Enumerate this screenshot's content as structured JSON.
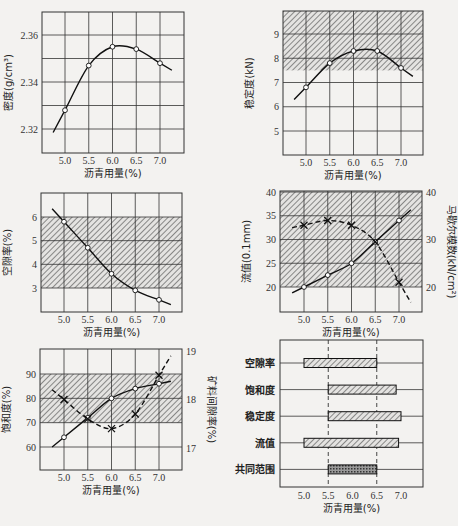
{
  "figure": {
    "xlabel_common": "沥青用量(%)"
  },
  "chart_data": [
    {
      "type": "line",
      "title": "",
      "xlabel": "沥青用量(%)",
      "ylabel": "密度(g/cm³)",
      "x_ticks": [
        "5.0",
        "5.5",
        "6.0",
        "6.5",
        "7.0"
      ],
      "y_ticks": [
        "2.32",
        "2.34",
        "2.36"
      ],
      "ylim": [
        2.31,
        2.37
      ],
      "grid": true,
      "series": [
        {
          "name": "密度",
          "x": [
            5.0,
            5.5,
            6.0,
            6.5,
            7.0
          ],
          "values": [
            2.328,
            2.347,
            2.355,
            2.354,
            2.348
          ]
        }
      ]
    },
    {
      "type": "line",
      "xlabel": "沥青用量(%)",
      "ylabel": "稳定度(kN)",
      "x_ticks": [
        "5.0",
        "5.5",
        "6.0",
        "6.5",
        "7.0"
      ],
      "y_ticks": [
        "5",
        "6",
        "7",
        "8",
        "9"
      ],
      "ylim": [
        4,
        10
      ],
      "grid": true,
      "shaded_range": [
        7.5,
        10
      ],
      "series": [
        {
          "name": "稳定度",
          "x": [
            5.0,
            5.5,
            6.0,
            6.5,
            7.0
          ],
          "values": [
            6.8,
            7.8,
            8.3,
            8.3,
            7.6
          ]
        }
      ]
    },
    {
      "type": "line",
      "xlabel": "沥青用量(%)",
      "ylabel": "空隙率(%)",
      "x_ticks": [
        "5.0",
        "5.5",
        "6.0",
        "6.5",
        "7.0"
      ],
      "y_ticks": [
        "3",
        "4",
        "5",
        "6"
      ],
      "ylim": [
        2,
        7
      ],
      "grid": true,
      "shaded_range": [
        3,
        6
      ],
      "series": [
        {
          "name": "空隙率",
          "x": [
            5.0,
            5.5,
            6.0,
            6.5,
            7.0
          ],
          "values": [
            5.8,
            4.7,
            3.6,
            2.9,
            2.5
          ]
        }
      ]
    },
    {
      "type": "line",
      "xlabel": "沥青用量(%)",
      "ylabel": "流值(0.1mm)",
      "ylabel_right": "马歇尔模数(kN/cm²)",
      "x_ticks": [
        "5.0",
        "5.5",
        "6.0",
        "6.5",
        "7.0"
      ],
      "y_ticks": [
        "20",
        "25",
        "30",
        "35",
        "40"
      ],
      "y_ticks_right": [
        "20",
        "30",
        "40"
      ],
      "ylim": [
        15,
        40
      ],
      "grid": true,
      "shaded_range": [
        20,
        40
      ],
      "series": [
        {
          "name": "流值",
          "style": "solid",
          "marker": "circle",
          "x": [
            5.0,
            5.5,
            6.0,
            6.5,
            7.0
          ],
          "values": [
            20,
            22.5,
            25,
            29.5,
            34
          ]
        },
        {
          "name": "马歇尔模数",
          "style": "dashed",
          "marker": "x",
          "x": [
            5.0,
            5.5,
            6.0,
            6.5,
            7.0
          ],
          "values": [
            33,
            34,
            33,
            29.5,
            21
          ]
        }
      ]
    },
    {
      "type": "line",
      "xlabel": "沥青用量(%)",
      "ylabel": "饱和度(%)",
      "ylabel_right": "矿料间隙率(%)",
      "x_ticks": [
        "5.0",
        "5.5",
        "6.0",
        "6.5",
        "7.0"
      ],
      "y_ticks": [
        "60",
        "70",
        "80",
        "90"
      ],
      "y_ticks_right": [
        "17",
        "18",
        "19"
      ],
      "ylim": [
        50,
        100
      ],
      "grid": true,
      "shaded_range": [
        70,
        90
      ],
      "series": [
        {
          "name": "饱和度",
          "style": "solid",
          "marker": "circle",
          "x": [
            5.0,
            5.5,
            6.0,
            6.5,
            7.0
          ],
          "values": [
            64,
            72,
            80,
            84,
            86
          ]
        },
        {
          "name": "矿料间隙率",
          "style": "dashed",
          "marker": "x",
          "x": [
            5.0,
            5.5,
            6.0,
            6.5,
            7.0
          ],
          "values": [
            18.0,
            17.6,
            17.4,
            17.7,
            18.5
          ]
        }
      ]
    },
    {
      "type": "bar",
      "orientation": "horizontal",
      "xlabel": "沥青用量(%)",
      "x_ticks": [
        "5.0",
        "5.5",
        "6.0",
        "6.5",
        "7.0"
      ],
      "categories": [
        "空隙率",
        "饱和度",
        "稳定度",
        "流值",
        "共同范围"
      ],
      "ranges": [
        [
          5.0,
          6.5
        ],
        [
          5.5,
          6.9
        ],
        [
          5.5,
          7.0
        ],
        [
          5.0,
          6.95
        ],
        [
          5.5,
          6.5
        ]
      ],
      "reference_lines": [
        5.5,
        6.5
      ]
    }
  ]
}
